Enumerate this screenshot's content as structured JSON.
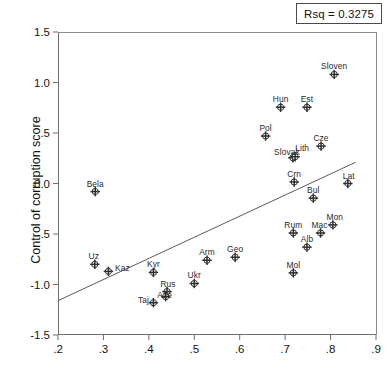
{
  "legend": {
    "rsq_text": "Rsq = 0.3275"
  },
  "axis": {
    "y_title": "Control of corruption score",
    "x_title": ""
  },
  "chart_data": {
    "type": "scatter",
    "title": "",
    "xlabel": "",
    "ylabel": "Control of corruption score",
    "xlim": [
      0.2,
      0.9
    ],
    "ylim": [
      -1.5,
      1.5
    ],
    "xticks": [
      0.2,
      0.3,
      0.4,
      0.5,
      0.6,
      0.7,
      0.8,
      0.9
    ],
    "xtick_labels": [
      ".2",
      ".3",
      ".4",
      ".5",
      ".6",
      ".7",
      ".8",
      ".9"
    ],
    "yticks": [
      -1.5,
      -1.0,
      -0.5,
      0.0,
      0.5,
      1.0,
      1.5
    ],
    "ytick_labels": [
      "-1.5",
      "-1.0",
      "-.5",
      "0.0",
      ".5",
      "1.0",
      "1.5"
    ],
    "grid": false,
    "legend_position": "top-right",
    "annotations": [
      {
        "text": "Rsq = 0.3275",
        "kind": "boxed-text",
        "position": "top-right"
      }
    ],
    "fit_line": {
      "type": "linear-regression",
      "x_start": 0.2,
      "y_start": -1.16,
      "x_end": 0.855,
      "y_end": 0.21,
      "rsq": 0.3275
    },
    "points": [
      {
        "label": "Bela",
        "x": 0.282,
        "y": -0.08,
        "lx": 0,
        "ly": -9
      },
      {
        "label": "Uz",
        "x": 0.281,
        "y": -0.8,
        "lx": -1,
        "ly": -9
      },
      {
        "label": "Kaz",
        "x": 0.311,
        "y": -0.87,
        "lx": 14,
        "ly": -4
      },
      {
        "label": "Kyr",
        "x": 0.41,
        "y": -0.88,
        "lx": 0,
        "ly": -9
      },
      {
        "label": "Taj",
        "x": 0.41,
        "y": -1.18,
        "lx": -10,
        "ly": -4
      },
      {
        "label": "Rus",
        "x": 0.44,
        "y": -1.07,
        "lx": 1,
        "ly": -9
      },
      {
        "label": "Aze",
        "x": 0.437,
        "y": -1.12,
        "lx": -1,
        "ly": -3
      },
      {
        "label": "Ukr",
        "x": 0.5,
        "y": -0.99,
        "lx": 0,
        "ly": -9
      },
      {
        "label": "Arm",
        "x": 0.528,
        "y": -0.76,
        "lx": 0,
        "ly": -9
      },
      {
        "label": "Geo",
        "x": 0.59,
        "y": -0.73,
        "lx": 0,
        "ly": -9
      },
      {
        "label": "Pol",
        "x": 0.657,
        "y": 0.47,
        "lx": 0,
        "ly": -9
      },
      {
        "label": "Hun",
        "x": 0.69,
        "y": 0.755,
        "lx": 0,
        "ly": -9
      },
      {
        "label": "Est",
        "x": 0.748,
        "y": 0.755,
        "lx": 0,
        "ly": -9
      },
      {
        "label": "Sloven",
        "x": 0.808,
        "y": 1.08,
        "lx": 0,
        "ly": -9
      },
      {
        "label": "Cze",
        "x": 0.779,
        "y": 0.37,
        "lx": 0,
        "ly": -9
      },
      {
        "label": "Slovak",
        "x": 0.717,
        "y": 0.255,
        "lx": -6,
        "ly": -7
      },
      {
        "label": "Lith",
        "x": 0.722,
        "y": 0.265,
        "lx": 7,
        "ly": -10
      },
      {
        "label": "Crn",
        "x": 0.72,
        "y": 0.015,
        "lx": 0,
        "ly": -9
      },
      {
        "label": "Lat",
        "x": 0.838,
        "y": 0.0,
        "lx": 1,
        "ly": -9
      },
      {
        "label": "Bul",
        "x": 0.762,
        "y": -0.145,
        "lx": 0,
        "ly": -9
      },
      {
        "label": "Mon",
        "x": 0.805,
        "y": -0.41,
        "lx": 2,
        "ly": -9
      },
      {
        "label": "Mac",
        "x": 0.778,
        "y": -0.49,
        "lx": -1,
        "ly": -9
      },
      {
        "label": "Rum",
        "x": 0.718,
        "y": -0.49,
        "lx": 0,
        "ly": -9
      },
      {
        "label": "Alb",
        "x": 0.748,
        "y": -0.63,
        "lx": 0,
        "ly": -9
      },
      {
        "label": "Mol",
        "x": 0.718,
        "y": -0.885,
        "lx": 0,
        "ly": -9
      }
    ]
  }
}
